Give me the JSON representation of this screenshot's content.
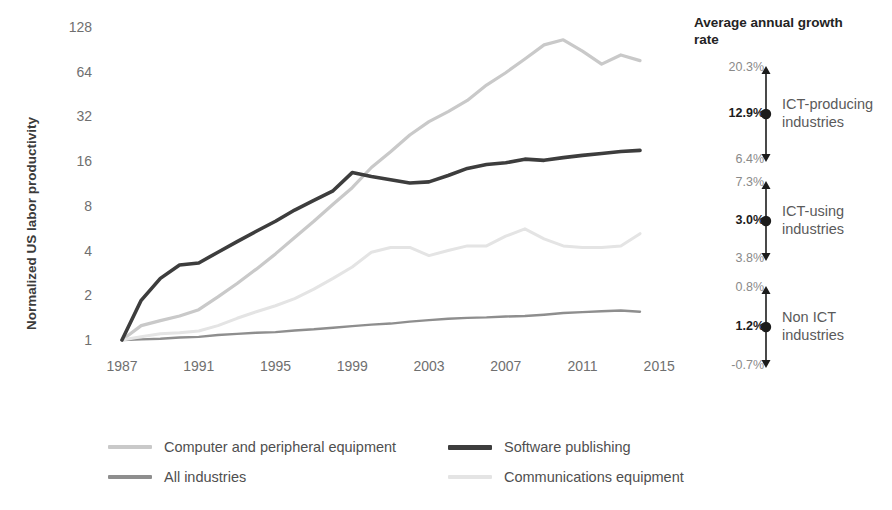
{
  "axis": {
    "ylabel": "Normalized US labor productivity",
    "yticks": [
      "128",
      "64",
      "32",
      "16",
      "8",
      "4",
      "2",
      "1"
    ],
    "xticks": [
      "1987",
      "1991",
      "1995",
      "1999",
      "2003",
      "2007",
      "2011",
      "2015"
    ]
  },
  "right_panel": {
    "title": "Average annual growth rate",
    "groups": [
      {
        "name_line1": "ICT-producing",
        "name_line2": "industries",
        "high": "20.3%",
        "mid": "12.9%",
        "low": "6.4%"
      },
      {
        "name_line1": "ICT-using",
        "name_line2": "industries",
        "high": "7.3%",
        "mid": "3.0%",
        "low": "3.8%"
      },
      {
        "name_line1": "Non  ICT",
        "name_line2": "industries",
        "high": "0.8%",
        "mid": "1.2%",
        "low": "-0.7%"
      }
    ]
  },
  "legend": {
    "items": [
      {
        "label": "Computer and peripheral equipment",
        "color": "#c9c9c9"
      },
      {
        "label": "All industries",
        "color": "#8e8e8e"
      },
      {
        "label": "Software publishing",
        "color": "#3d3d3d"
      },
      {
        "label": "Communications equipment",
        "color": "#e4e4e4"
      }
    ]
  },
  "chart_data": {
    "type": "line",
    "title": "",
    "xlabel": "",
    "ylabel": "Normalized US labor productivity",
    "yscale": "log2",
    "ylim": [
      1,
      128
    ],
    "xlim": [
      1987,
      2015
    ],
    "grid": false,
    "legend_position": "bottom",
    "x": [
      1987,
      1988,
      1989,
      1990,
      1991,
      1992,
      1993,
      1994,
      1995,
      1996,
      1997,
      1998,
      1999,
      2000,
      2001,
      2002,
      2003,
      2004,
      2005,
      2006,
      2007,
      2008,
      2009,
      2010,
      2011,
      2012,
      2013,
      2014
    ],
    "series": [
      {
        "name": "Software publishing",
        "color": "#3d3d3d",
        "width": 3.6,
        "values": [
          1.0,
          1.85,
          2.6,
          3.2,
          3.3,
          3.9,
          4.6,
          5.4,
          6.3,
          7.5,
          8.7,
          10.1,
          13.4,
          12.6,
          12.0,
          11.4,
          11.6,
          12.8,
          14.3,
          15.2,
          15.6,
          16.5,
          16.2,
          16.9,
          17.5,
          18.0,
          18.6,
          18.9
        ]
      },
      {
        "name": "Computer and peripheral equipment",
        "color": "#c9c9c9",
        "width": 3.2,
        "values": [
          1.0,
          1.25,
          1.35,
          1.45,
          1.6,
          1.95,
          2.4,
          3.0,
          3.8,
          4.9,
          6.3,
          8.2,
          10.6,
          14.5,
          18.5,
          24.0,
          29.5,
          34.5,
          41.0,
          52.0,
          63.0,
          78.0,
          97.0,
          105.0,
          88.0,
          72.0,
          83.0,
          76.0
        ]
      },
      {
        "name": "Communications equipment",
        "color": "#e4e4e4",
        "width": 3.0,
        "values": [
          1.0,
          1.05,
          1.1,
          1.12,
          1.15,
          1.25,
          1.4,
          1.55,
          1.7,
          1.9,
          2.2,
          2.6,
          3.1,
          3.9,
          4.2,
          4.2,
          3.7,
          4.0,
          4.3,
          4.3,
          5.0,
          5.6,
          4.8,
          4.3,
          4.2,
          4.2,
          4.3,
          5.2
        ]
      },
      {
        "name": "All industries",
        "color": "#8e8e8e",
        "width": 2.4,
        "values": [
          1.0,
          1.01,
          1.02,
          1.04,
          1.05,
          1.08,
          1.1,
          1.12,
          1.13,
          1.16,
          1.18,
          1.21,
          1.24,
          1.27,
          1.29,
          1.33,
          1.36,
          1.39,
          1.41,
          1.42,
          1.44,
          1.45,
          1.48,
          1.52,
          1.54,
          1.56,
          1.58,
          1.55
        ]
      }
    ]
  }
}
